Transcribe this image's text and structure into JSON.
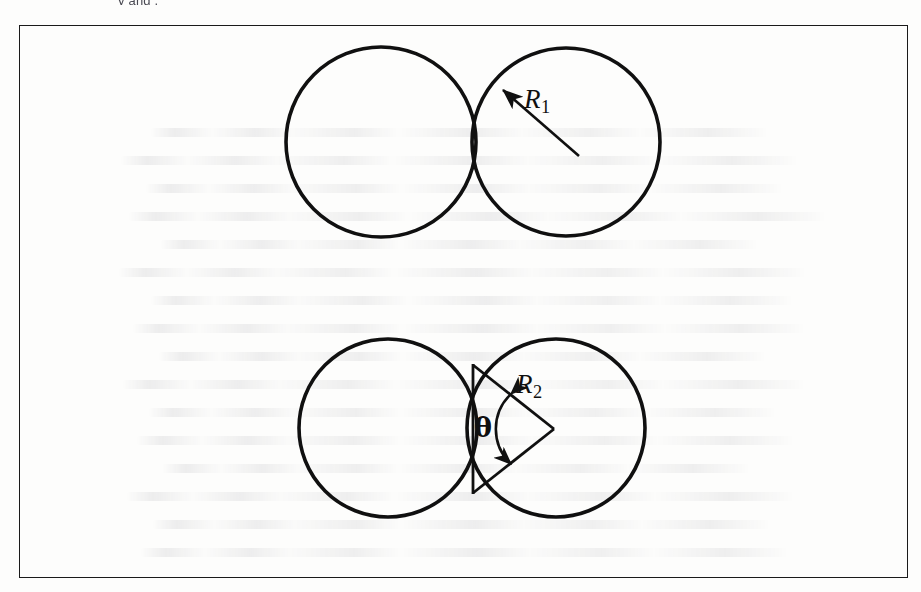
{
  "page": {
    "kind": "scanned-textbook-figure",
    "background_color": "#fdfdfc",
    "ink_color": "#101010",
    "top_cut_text": "y                                           and                 ."
  },
  "frame": {
    "name": "figure-border",
    "x": 19,
    "y": 25,
    "width": 889,
    "height": 553,
    "stroke_color": "#1a1a1a",
    "stroke_width": 1.6
  },
  "figures": [
    {
      "id": "top-figure",
      "caption": "",
      "description": "Two externally tangent circles of equal radius; right circle annotated with radius arrow R1",
      "circles": [
        {
          "name": "top-left-circle",
          "cx": 381,
          "cy": 142,
          "r": 95
        },
        {
          "name": "top-right-circle",
          "cx": 566,
          "cy": 142,
          "r": 94
        }
      ],
      "annotations": [
        {
          "name": "radius-arrow-r1",
          "type": "arrow",
          "from": {
            "x": 578,
            "y": 155
          },
          "to": {
            "x": 501,
            "y": 88
          },
          "label": "R",
          "subscript": "1"
        }
      ]
    },
    {
      "id": "bottom-figure",
      "caption": "",
      "description": "Two overlapping circles of equal radius; triangle formed by the common chord and two radii of the right circle, with central half-angle theta and radius R2",
      "circles": [
        {
          "name": "bottom-left-circle",
          "cx": 388,
          "cy": 428,
          "r": 89
        },
        {
          "name": "bottom-right-circle",
          "cx": 556,
          "cy": 428,
          "r": 89
        }
      ],
      "intersection_points": [
        {
          "name": "upper-intersection",
          "x": 473,
          "y": 366
        },
        {
          "name": "lower-intersection",
          "x": 473,
          "y": 492
        }
      ],
      "triangle": {
        "name": "chord-radius-triangle",
        "vertices": [
          {
            "x": 473,
            "y": 366
          },
          {
            "x": 473,
            "y": 492
          },
          {
            "x": 553,
            "y": 429
          }
        ]
      },
      "annotations": [
        {
          "name": "radius-label-r2",
          "type": "label",
          "label": "R",
          "subscript": "2",
          "x": 516,
          "y": 371
        },
        {
          "name": "angle-arc-theta",
          "type": "double-headed-arc",
          "label": "θ",
          "x": 474,
          "y": 414
        }
      ]
    }
  ],
  "labels": {
    "r1": {
      "text": "R",
      "subscript": "1"
    },
    "r2": {
      "text": "R",
      "subscript": "2"
    },
    "theta": {
      "text": "θ"
    }
  }
}
